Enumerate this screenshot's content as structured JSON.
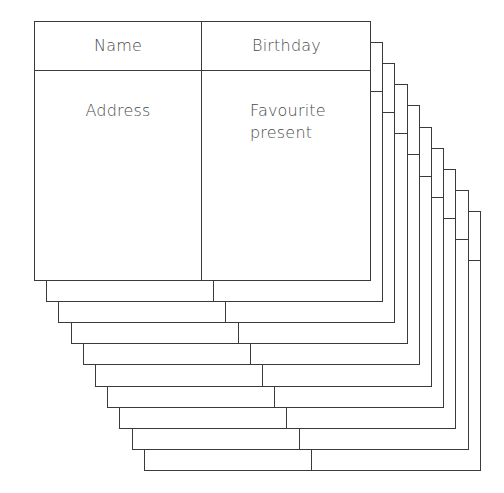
{
  "diagram": {
    "type": "stacked-record-cards",
    "card_count": 10,
    "front_card": {
      "fields": {
        "name": "Name",
        "birthday": "Birthday",
        "address": "Address",
        "favourite_present": "Favourite\npresent"
      }
    },
    "colors": {
      "line": "#3a3a3a",
      "text": "#4a4a4a",
      "background": "#ffffff"
    }
  }
}
